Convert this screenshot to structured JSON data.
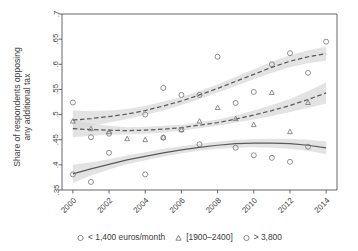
{
  "chart_data": {
    "type": "scatter",
    "title": "",
    "subtitle": "",
    "xlabel": "",
    "ylabel": "Share of respondents opposing any additional tax",
    "ylabel_line1": "Share of respondents opposing",
    "ylabel_line2": "any additional tax",
    "xlim": [
      1999.4,
      2014.6
    ],
    "ylim": [
      0.35,
      0.7
    ],
    "yticks": [
      0.35,
      0.4,
      0.45,
      0.5,
      0.55,
      0.6,
      0.65,
      0.7
    ],
    "ytick_labels": [
      ".35",
      ".4",
      ".45",
      ".5",
      ".55",
      ".6",
      ".65",
      ".7"
    ],
    "xticks": [
      2000,
      2002,
      2004,
      2006,
      2008,
      2010,
      2012,
      2014
    ],
    "xtick_labels": [
      "2000",
      "2002",
      "2004",
      "2006",
      "2008",
      "2010",
      "2012",
      "2014"
    ],
    "xtick_label_rotation": -45,
    "grid": false,
    "legend_position": "bottom",
    "marker_color": "#7b7b7b",
    "fit_color": "#5a5a5a",
    "band_color": "#d8d8d8",
    "axis_color": "#555555",
    "series": [
      {
        "name": "< 1,400 euros/month",
        "legend_label": "< 1,400 euros/month",
        "marker": "circle",
        "fit_style": "solid",
        "x": [
          2000,
          2001,
          2002,
          2004,
          2005,
          2006,
          2007,
          2009,
          2010,
          2011,
          2012,
          2013
        ],
        "values": [
          0.381,
          0.366,
          0.424,
          0.381,
          0.454,
          0.47,
          0.441,
          0.434,
          0.419,
          0.414,
          0.406,
          0.436
        ],
        "fit_x": [
          2000,
          2001,
          2002,
          2003,
          2004,
          2005,
          2006,
          2007,
          2008,
          2009,
          2010,
          2011,
          2012,
          2013,
          2014
        ],
        "fit_y": [
          0.382,
          0.392,
          0.401,
          0.41,
          0.417,
          0.424,
          0.43,
          0.435,
          0.439,
          0.442,
          0.443,
          0.443,
          0.442,
          0.439,
          0.434
        ],
        "band_lo": [
          0.364,
          0.379,
          0.391,
          0.401,
          0.409,
          0.416,
          0.423,
          0.428,
          0.432,
          0.434,
          0.435,
          0.434,
          0.432,
          0.428,
          0.421
        ],
        "band_hi": [
          0.4,
          0.405,
          0.411,
          0.419,
          0.425,
          0.432,
          0.437,
          0.442,
          0.446,
          0.45,
          0.451,
          0.452,
          0.452,
          0.45,
          0.447
        ]
      },
      {
        "name": "[1900-2400]",
        "legend_label": "[1900–2400]",
        "marker": "triangle",
        "fit_style": "dashed",
        "x": [
          2000,
          2001,
          2002,
          2003,
          2004,
          2005,
          2006,
          2007,
          2008,
          2009,
          2010,
          2011,
          2012,
          2013
        ],
        "values": [
          0.487,
          0.472,
          0.466,
          0.452,
          0.45,
          0.455,
          0.47,
          0.487,
          0.514,
          0.492,
          0.48,
          0.544,
          0.466,
          0.524
        ],
        "fit_x": [
          2000,
          2001,
          2002,
          2003,
          2004,
          2005,
          2006,
          2007,
          2008,
          2009,
          2010,
          2011,
          2012,
          2013,
          2014
        ],
        "fit_y": [
          0.472,
          0.47,
          0.469,
          0.468,
          0.469,
          0.471,
          0.474,
          0.479,
          0.484,
          0.491,
          0.499,
          0.508,
          0.518,
          0.53,
          0.543
        ],
        "band_lo": [
          0.455,
          0.458,
          0.46,
          0.461,
          0.462,
          0.464,
          0.468,
          0.473,
          0.478,
          0.484,
          0.49,
          0.497,
          0.505,
          0.513,
          0.522
        ],
        "band_hi": [
          0.489,
          0.482,
          0.478,
          0.475,
          0.476,
          0.478,
          0.48,
          0.485,
          0.49,
          0.498,
          0.508,
          0.519,
          0.531,
          0.547,
          0.564
        ]
      },
      {
        "name": "> 3,800",
        "legend_label": "> 3,800",
        "marker": "circle-open",
        "fit_style": "dashed",
        "x": [
          2000,
          2001,
          2002,
          2004,
          2005,
          2006,
          2007,
          2008,
          2009,
          2010,
          2011,
          2012,
          2013,
          2014
        ],
        "values": [
          0.524,
          0.455,
          0.462,
          0.5,
          0.553,
          0.539,
          0.539,
          0.615,
          0.523,
          0.545,
          0.6,
          0.622,
          0.583,
          0.645
        ],
        "fit_x": [
          2000,
          2001,
          2002,
          2003,
          2004,
          2005,
          2006,
          2007,
          2008,
          2009,
          2010,
          2011,
          2012,
          2013,
          2014
        ],
        "fit_y": [
          0.489,
          0.492,
          0.496,
          0.501,
          0.508,
          0.517,
          0.527,
          0.539,
          0.552,
          0.566,
          0.58,
          0.594,
          0.606,
          0.615,
          0.621
        ],
        "band_lo": [
          0.47,
          0.477,
          0.484,
          0.491,
          0.499,
          0.508,
          0.519,
          0.531,
          0.544,
          0.557,
          0.57,
          0.583,
          0.594,
          0.602,
          0.607
        ],
        "band_hi": [
          0.508,
          0.507,
          0.508,
          0.511,
          0.517,
          0.526,
          0.535,
          0.547,
          0.56,
          0.575,
          0.59,
          0.605,
          0.618,
          0.628,
          0.635
        ]
      }
    ]
  }
}
